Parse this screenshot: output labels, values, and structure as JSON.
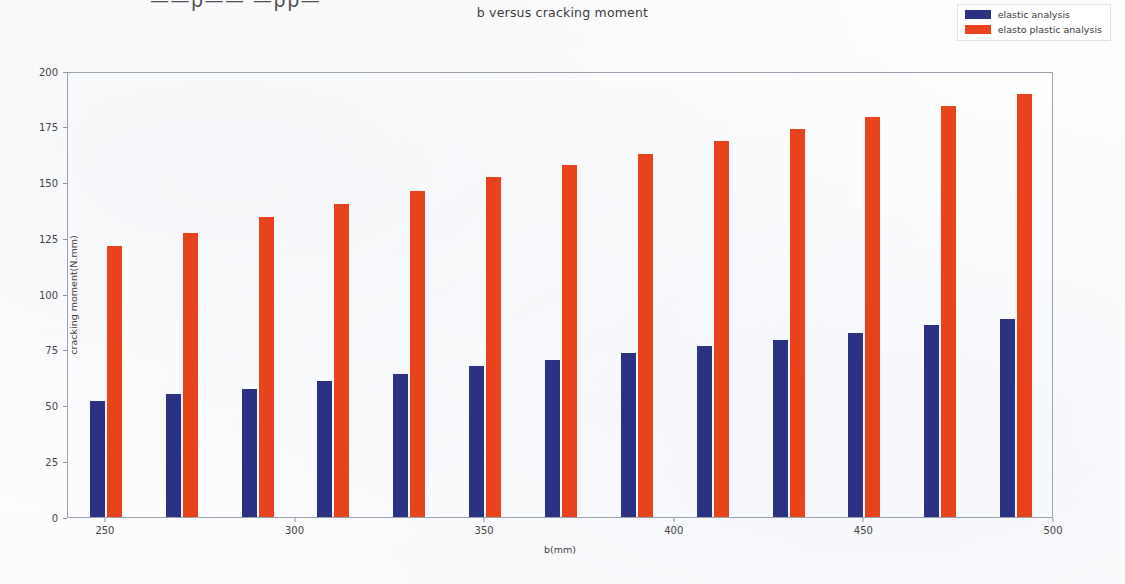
{
  "header": {
    "cut_off_text": "——ρ——  —ρρ—"
  },
  "legend": {
    "position": "top-right",
    "entries": [
      {
        "label": "elastic analysis",
        "color": "#2b3284",
        "icon": "legend-swatch"
      },
      {
        "label": "elasto plastic analysis",
        "color": "#e8431a",
        "icon": "legend-swatch"
      }
    ]
  },
  "chart_data": {
    "type": "bar",
    "title": "b versus cracking moment",
    "xlabel": "b(mm)",
    "ylabel": "cracking moment(N.mm)",
    "grid": false,
    "legend_position": "upper right",
    "xlim": [
      240,
      500
    ],
    "ylim": [
      0,
      200
    ],
    "y_ticks": [
      0,
      25,
      50,
      75,
      100,
      125,
      150,
      175,
      200
    ],
    "x_ticks": [
      250,
      300,
      350,
      400,
      450,
      500
    ],
    "categories": [
      250,
      270,
      290,
      310,
      330,
      350,
      370,
      390,
      410,
      430,
      450,
      470,
      490
    ],
    "series": [
      {
        "name": "elastic analysis",
        "color": "#2b3284",
        "values": [
          52,
          55,
          57.5,
          61,
          64,
          67.5,
          70.5,
          73.5,
          76.5,
          79.5,
          82.5,
          86,
          89
        ]
      },
      {
        "name": "elasto plastic analysis",
        "color": "#e8431a",
        "values": [
          121.5,
          127.5,
          134.5,
          140.5,
          146,
          152.5,
          158,
          163,
          168.5,
          174,
          179.5,
          184.5,
          189.5
        ]
      }
    ]
  }
}
